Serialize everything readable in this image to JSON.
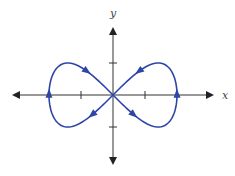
{
  "chart_data": {
    "type": "line",
    "title": "",
    "xlabel": "x",
    "ylabel": "y",
    "parametric": {
      "x": "2cos(t)",
      "y": "sin(2t)",
      "t_range": [
        0,
        6.2832
      ]
    },
    "xlim": [
      -3.1,
      3.1
    ],
    "ylim": [
      -2.1,
      2.1
    ],
    "x_ticks": [
      -1,
      1
    ],
    "y_ticks": [
      -1,
      1
    ],
    "grid": false,
    "curve_color": "#2e45a8",
    "axis_color": "#333333",
    "direction_arrows": [
      {
        "at": "right extreme (2,0)",
        "direction": "up"
      },
      {
        "at": "upper-right lobe",
        "direction": "down-left toward origin"
      },
      {
        "at": "lower-left near origin",
        "direction": "down-left"
      },
      {
        "at": "left extreme (-2,0)",
        "direction": "up"
      },
      {
        "at": "upper-left lobe",
        "direction": "down-right toward origin"
      },
      {
        "at": "lower-right near origin",
        "direction": "down-right"
      }
    ]
  },
  "labels": {
    "x_axis": "x",
    "y_axis": "y"
  }
}
